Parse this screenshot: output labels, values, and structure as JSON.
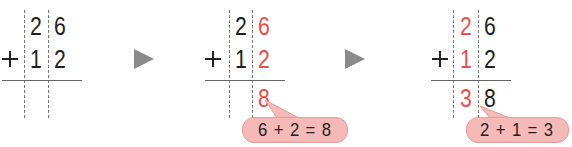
{
  "colors": {
    "highlight": "#e8504a",
    "text": "#1f1f1f",
    "bubble_fill": "#f5b9b8",
    "bubble_border": "#e99b9a",
    "arrow": "#8a8a8a"
  },
  "operator": "+",
  "steps": [
    {
      "top": [
        "2",
        "6"
      ],
      "bottom": [
        "1",
        "2"
      ],
      "result": [
        "",
        ""
      ],
      "highlight": "none",
      "bubble": null
    },
    {
      "top": [
        "2",
        "6"
      ],
      "bottom": [
        "1",
        "2"
      ],
      "result": [
        "",
        "8"
      ],
      "highlight": "ones",
      "bubble": "6 + 2 = 8"
    },
    {
      "top": [
        "2",
        "6"
      ],
      "bottom": [
        "1",
        "2"
      ],
      "result": [
        "3",
        "8"
      ],
      "highlight": "tens",
      "bubble": "2 + 1 = 3"
    }
  ],
  "arrows": [
    "play-arrow-icon",
    "play-arrow-icon"
  ]
}
